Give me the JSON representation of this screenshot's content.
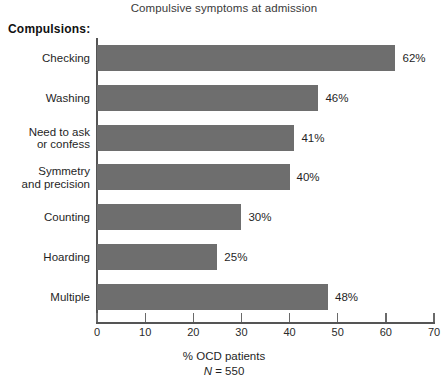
{
  "chart_data": {
    "type": "bar",
    "orientation": "horizontal",
    "title": "Compulsive symptoms at admission",
    "group_label": "Compulsions:",
    "categories": [
      "Checking",
      "Washing",
      "Need to ask\nor confess",
      "Symmetry\nand precision",
      "Counting",
      "Hoarding",
      "Multiple"
    ],
    "category_lines": [
      [
        "Checking"
      ],
      [
        "Washing"
      ],
      [
        "Need to ask",
        "or confess"
      ],
      [
        "Symmetry",
        "and precision"
      ],
      [
        "Counting"
      ],
      [
        "Hoarding"
      ],
      [
        "Multiple"
      ]
    ],
    "values": [
      62,
      46,
      41,
      40,
      30,
      25,
      48
    ],
    "value_labels": [
      "62%",
      "46%",
      "41%",
      "40%",
      "30%",
      "25%",
      "48%"
    ],
    "xlabel": "% OCD patients",
    "ylabel": "",
    "xlim": [
      0,
      70
    ],
    "xticks": [
      0,
      10,
      20,
      30,
      40,
      50,
      60,
      70
    ],
    "xtick_labels": [
      "0",
      "10",
      "20",
      "30",
      "40",
      "50",
      "60",
      "70"
    ],
    "grid": false,
    "legend": null,
    "annotations": {
      "sample_size_prefix": "N",
      "sample_size_text": "= 550",
      "sample_size_full": "N = 550"
    },
    "colors": {
      "bar_fill": "#6e6e6e",
      "axis": "#555555",
      "text": "#1f1f1f",
      "title": "#3a3a3a",
      "background": "#ffffff"
    }
  }
}
